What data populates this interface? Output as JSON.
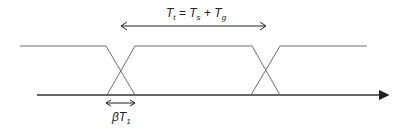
{
  "diagram": {
    "type": "timing-diagram",
    "top_label": {
      "T": "T",
      "t_sub": "t",
      "eq": " = ",
      "Ts": "T",
      "s_sub": "s",
      "plus": " + ",
      "Tg": "T",
      "g_sub": "g"
    },
    "bottom_label": {
      "beta": "β",
      "T": "T",
      "sub": "1"
    },
    "colors": {
      "signal": "#6e6e6e",
      "axis": "#333333",
      "text": "#222222"
    }
  }
}
